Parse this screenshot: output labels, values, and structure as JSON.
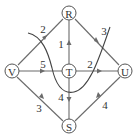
{
  "diagram": {
    "type": "directed-flow-network-with-cut",
    "nodes": [
      {
        "id": "R",
        "label": "R",
        "x": 69,
        "y": 13
      },
      {
        "id": "V",
        "label": "V",
        "x": 12,
        "y": 71
      },
      {
        "id": "T",
        "label": "T",
        "x": 69,
        "y": 71
      },
      {
        "id": "U",
        "label": "U",
        "x": 125,
        "y": 71
      },
      {
        "id": "S",
        "label": "S",
        "x": 69,
        "y": 126
      }
    ],
    "edges": [
      {
        "from": "V",
        "to": "R",
        "weight": "2"
      },
      {
        "from": "R",
        "to": "U",
        "weight": "3"
      },
      {
        "from": "T",
        "to": "R",
        "weight": "1"
      },
      {
        "from": "V",
        "to": "T",
        "weight": "5"
      },
      {
        "from": "T",
        "to": "U",
        "weight": "2"
      },
      {
        "from": "V",
        "to": "S",
        "weight": "3"
      },
      {
        "from": "T",
        "to": "S",
        "weight": "4"
      },
      {
        "from": "U",
        "to": "S",
        "weight": "4"
      }
    ],
    "cut_curve": "freehand cut line crossing edges V-R, V-T, T-S, T-U, R-U"
  }
}
